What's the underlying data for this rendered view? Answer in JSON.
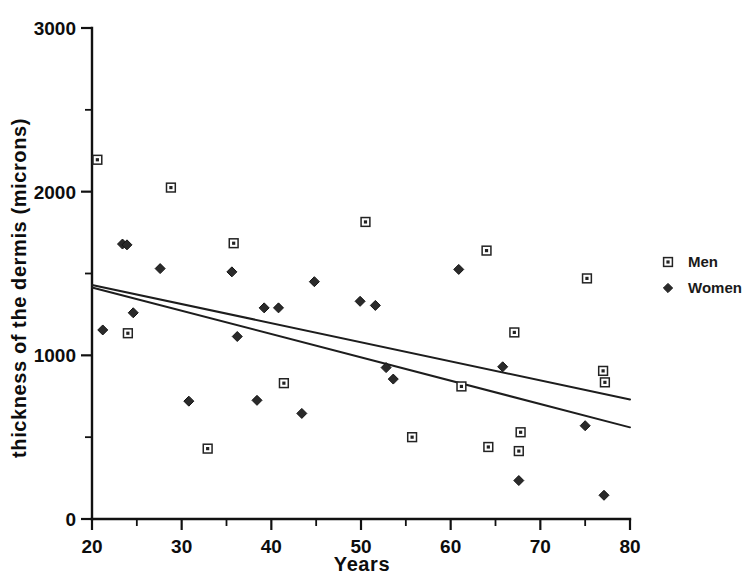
{
  "chart_data": {
    "type": "scatter",
    "title": "",
    "xlabel": "Years",
    "ylabel": "thickness of the dermis (microns)",
    "xlim": [
      20,
      80
    ],
    "ylim": [
      0,
      3000
    ],
    "xticks": [
      20,
      30,
      40,
      50,
      60,
      70,
      80
    ],
    "xtick_labels": [
      "20",
      "30",
      "40",
      "50",
      "60",
      "70",
      "80"
    ],
    "xminor_step": 5,
    "yticks": [
      0,
      1000,
      2000,
      3000
    ],
    "ytick_labels": [
      "0",
      "1000",
      "2000",
      "3000"
    ],
    "yminor_step": 500,
    "grid": false,
    "legend_position": "right",
    "series": [
      {
        "name": "Men",
        "marker": "open-square",
        "points": [
          [
            20.6,
            2195
          ],
          [
            24.0,
            1135
          ],
          [
            28.8,
            2025
          ],
          [
            32.9,
            430
          ],
          [
            35.8,
            1685
          ],
          [
            41.4,
            830
          ],
          [
            50.5,
            1815
          ],
          [
            55.7,
            500
          ],
          [
            61.2,
            810
          ],
          [
            64.0,
            1640
          ],
          [
            64.2,
            440
          ],
          [
            67.1,
            1140
          ],
          [
            67.6,
            415
          ],
          [
            67.8,
            530
          ],
          [
            75.2,
            1470
          ],
          [
            77.0,
            905
          ],
          [
            77.2,
            835
          ]
        ]
      },
      {
        "name": "Women",
        "marker": "filled-diamond",
        "points": [
          [
            21.2,
            1155
          ],
          [
            23.4,
            1680
          ],
          [
            23.9,
            1675
          ],
          [
            24.6,
            1260
          ],
          [
            27.6,
            1530
          ],
          [
            30.8,
            720
          ],
          [
            35.6,
            1510
          ],
          [
            36.2,
            1115
          ],
          [
            38.4,
            725
          ],
          [
            39.2,
            1290
          ],
          [
            40.8,
            1290
          ],
          [
            43.4,
            645
          ],
          [
            44.8,
            1450
          ],
          [
            49.9,
            1330
          ],
          [
            51.6,
            1305
          ],
          [
            52.8,
            925
          ],
          [
            53.6,
            855
          ],
          [
            60.9,
            1525
          ],
          [
            65.8,
            930
          ],
          [
            67.6,
            235
          ],
          [
            75.0,
            570
          ],
          [
            77.1,
            145
          ]
        ]
      }
    ],
    "fit_lines": [
      {
        "series": "Men",
        "x_start": 20,
        "y_start": 1430,
        "x_end": 80,
        "y_end": 730
      },
      {
        "series": "Women",
        "x_start": 20,
        "y_start": 1415,
        "x_end": 80,
        "y_end": 560
      }
    ]
  },
  "legend": {
    "entries": [
      {
        "label": "Men",
        "marker": "open-square"
      },
      {
        "label": "Women",
        "marker": "filled-diamond"
      }
    ]
  }
}
